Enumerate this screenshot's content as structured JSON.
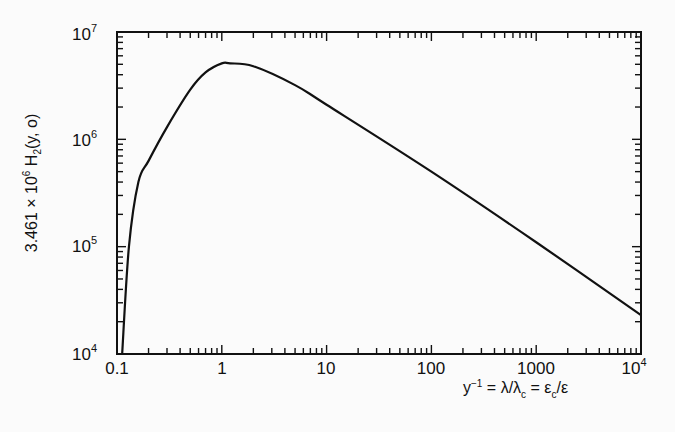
{
  "chart_data": {
    "type": "line",
    "title": "",
    "xlabel": "y^-1 = λ/λc = εc/ε",
    "ylabel": "3.461 × 10^6 H2(y, o)",
    "xscale": "log",
    "yscale": "log",
    "xlim": [
      0.1,
      10000
    ],
    "ylim": [
      10000,
      10000000
    ],
    "grid": false,
    "legend": null,
    "x_ticks": [
      "0.1",
      "1",
      "10",
      "100",
      "1000",
      "10^4"
    ],
    "y_ticks": [
      "10^4",
      "10^5",
      "10^6",
      "10^7"
    ],
    "series": [
      {
        "name": "3.461e6 H2(y,0)",
        "x": [
          0.112,
          0.13,
          0.16,
          0.2,
          0.3,
          0.5,
          0.7,
          1.0,
          1.2,
          2.0,
          5.0,
          10,
          100,
          1000,
          10000
        ],
        "y": [
          10000,
          100000,
          400000,
          630000,
          1300000,
          2900000,
          4200000,
          5100000,
          5100000,
          4800000,
          3200000,
          2100000,
          500000,
          110000,
          23000
        ]
      }
    ]
  },
  "labels": {
    "y_prefix": "3.461 × 10",
    "y_exp": "6",
    "y_func": " H",
    "y_sub": "2",
    "y_args": "(y, o)",
    "x_base": "y",
    "x_exp": "−1",
    "x_eq1": " = λ/λ",
    "x_sub1": "c",
    "x_eq2": " = ε",
    "x_sub2": "c",
    "x_tail": "/ε"
  },
  "ticks": {
    "x": [
      {
        "label": "0.1",
        "base": "0.1",
        "exp": ""
      },
      {
        "label": "1",
        "base": "1",
        "exp": ""
      },
      {
        "label": "10",
        "base": "10",
        "exp": ""
      },
      {
        "label": "100",
        "base": "100",
        "exp": ""
      },
      {
        "label": "1000",
        "base": "1000",
        "exp": ""
      },
      {
        "label": "10^4",
        "base": "10",
        "exp": "4"
      }
    ],
    "y": [
      {
        "base": "10",
        "exp": "7"
      },
      {
        "base": "10",
        "exp": "6"
      },
      {
        "base": "10",
        "exp": "5"
      },
      {
        "base": "10",
        "exp": "4"
      }
    ]
  },
  "colors": {
    "line": "#111111",
    "axis": "#111111",
    "background": "#fbfbfb"
  }
}
